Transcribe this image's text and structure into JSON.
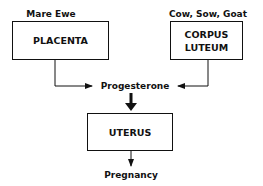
{
  "diagram": {
    "nodes": {
      "placenta": {
        "label": "PLACENTA",
        "species": "Mare Ewe"
      },
      "corpus_luteum": {
        "label_line1": "CORPUS",
        "label_line2": "LUTEUM",
        "species": "Cow, Sow, Goat"
      },
      "progesterone": {
        "label": "Progesterone"
      },
      "uterus": {
        "label": "UTERUS"
      },
      "pregnancy": {
        "label": "Pregnancy"
      }
    },
    "edges": [
      {
        "from": "placenta",
        "to": "progesterone"
      },
      {
        "from": "corpus_luteum",
        "to": "progesterone"
      },
      {
        "from": "progesterone",
        "to": "uterus",
        "style": "bold"
      },
      {
        "from": "uterus",
        "to": "pregnancy"
      }
    ]
  }
}
